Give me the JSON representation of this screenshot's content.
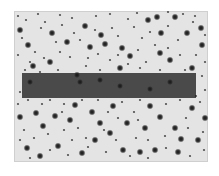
{
  "image": {
    "width": 219,
    "height": 176,
    "description": "Grayscale negative star field with a dark horizontal band",
    "frame": {
      "x": 14,
      "y": 11,
      "w": 194,
      "h": 151,
      "fill": "#e4e4e4"
    },
    "band": {
      "x": 22,
      "y": 73,
      "w": 174,
      "h": 25,
      "fill": "#4a4a4a"
    },
    "star_color": "#1e1e1e",
    "stars_large": [
      [
        20,
        30
      ],
      [
        28,
        45
      ],
      [
        33,
        66
      ],
      [
        52,
        33
      ],
      [
        50,
        62
      ],
      [
        85,
        26
      ],
      [
        90,
        47
      ],
      [
        77,
        75
      ],
      [
        67,
        42
      ],
      [
        105,
        44
      ],
      [
        101,
        35
      ],
      [
        122,
        48
      ],
      [
        130,
        56
      ],
      [
        148,
        20
      ],
      [
        157,
        17
      ],
      [
        161,
        33
      ],
      [
        160,
        53
      ],
      [
        175,
        17
      ],
      [
        187,
        33
      ],
      [
        201,
        28
      ],
      [
        202,
        45
      ],
      [
        192,
        68
      ],
      [
        120,
        68
      ],
      [
        170,
        60
      ],
      [
        30,
        82
      ],
      [
        80,
        82
      ],
      [
        100,
        80
      ],
      [
        120,
        86
      ],
      [
        150,
        89
      ],
      [
        170,
        82
      ],
      [
        20,
        117
      ],
      [
        36,
        113
      ],
      [
        55,
        116
      ],
      [
        70,
        120
      ],
      [
        75,
        105
      ],
      [
        92,
        112
      ],
      [
        100,
        123
      ],
      [
        43,
        126
      ],
      [
        110,
        133
      ],
      [
        127,
        123
      ],
      [
        145,
        128
      ],
      [
        160,
        117
      ],
      [
        175,
        128
      ],
      [
        192,
        108
      ],
      [
        205,
        118
      ],
      [
        181,
        139
      ],
      [
        198,
        140
      ],
      [
        27,
        148
      ],
      [
        58,
        146
      ],
      [
        82,
        153
      ],
      [
        123,
        150
      ],
      [
        140,
        152
      ],
      [
        155,
        150
      ],
      [
        178,
        152
      ],
      [
        40,
        156
      ],
      [
        95,
        140
      ],
      [
        113,
        106
      ],
      [
        150,
        106
      ]
    ],
    "stars_small": [
      [
        18,
        16
      ],
      [
        26,
        20
      ],
      [
        38,
        14
      ],
      [
        45,
        22
      ],
      [
        60,
        15
      ],
      [
        72,
        18
      ],
      [
        96,
        16
      ],
      [
        110,
        14
      ],
      [
        128,
        19
      ],
      [
        137,
        13
      ],
      [
        168,
        12
      ],
      [
        183,
        14
      ],
      [
        195,
        16
      ],
      [
        22,
        38
      ],
      [
        41,
        28
      ],
      [
        56,
        42
      ],
      [
        62,
        25
      ],
      [
        74,
        33
      ],
      [
        80,
        40
      ],
      [
        95,
        30
      ],
      [
        112,
        28
      ],
      [
        118,
        36
      ],
      [
        134,
        27
      ],
      [
        142,
        38
      ],
      [
        150,
        32
      ],
      [
        168,
        26
      ],
      [
        178,
        40
      ],
      [
        193,
        22
      ],
      [
        205,
        35
      ],
      [
        18,
        55
      ],
      [
        35,
        52
      ],
      [
        44,
        58
      ],
      [
        60,
        52
      ],
      [
        70,
        57
      ],
      [
        88,
        58
      ],
      [
        98,
        54
      ],
      [
        110,
        60
      ],
      [
        118,
        55
      ],
      [
        138,
        50
      ],
      [
        146,
        62
      ],
      [
        155,
        45
      ],
      [
        168,
        48
      ],
      [
        180,
        55
      ],
      [
        196,
        55
      ],
      [
        205,
        62
      ],
      [
        25,
        70
      ],
      [
        40,
        72
      ],
      [
        58,
        70
      ],
      [
        100,
        70
      ],
      [
        140,
        68
      ],
      [
        160,
        70
      ],
      [
        185,
        70
      ],
      [
        202,
        76
      ],
      [
        20,
        92
      ],
      [
        205,
        90
      ],
      [
        18,
        104
      ],
      [
        28,
        100
      ],
      [
        42,
        104
      ],
      [
        50,
        100
      ],
      [
        64,
        104
      ],
      [
        82,
        100
      ],
      [
        98,
        100
      ],
      [
        108,
        112
      ],
      [
        122,
        102
      ],
      [
        134,
        112
      ],
      [
        140,
        100
      ],
      [
        166,
        104
      ],
      [
        180,
        100
      ],
      [
        200,
        102
      ],
      [
        24,
        130
      ],
      [
        34,
        138
      ],
      [
        48,
        134
      ],
      [
        64,
        130
      ],
      [
        78,
        128
      ],
      [
        86,
        138
      ],
      [
        104,
        130
      ],
      [
        116,
        140
      ],
      [
        136,
        138
      ],
      [
        148,
        140
      ],
      [
        165,
        136
      ],
      [
        188,
        128
      ],
      [
        203,
        132
      ],
      [
        20,
        140
      ],
      [
        30,
        158
      ],
      [
        50,
        150
      ],
      [
        68,
        155
      ],
      [
        88,
        147
      ],
      [
        106,
        152
      ],
      [
        130,
        156
      ],
      [
        148,
        158
      ],
      [
        166,
        148
      ],
      [
        190,
        156
      ],
      [
        204,
        150
      ],
      [
        72,
        140
      ],
      [
        118,
        118
      ],
      [
        138,
        120
      ],
      [
        62,
        112
      ],
      [
        186,
        118
      ],
      [
        196,
        96
      ],
      [
        30,
        62
      ],
      [
        86,
        66
      ],
      [
        128,
        64
      ]
    ]
  }
}
